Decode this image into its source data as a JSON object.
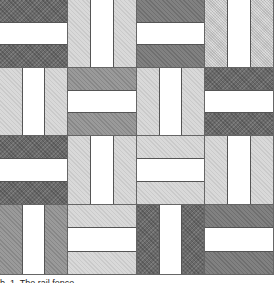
{
  "figure": {
    "type": "rail-fence quilt pattern",
    "grid": {
      "rows": 4,
      "cols": 4
    },
    "tones": {
      "white": "#ffffff",
      "dark": "#6a6a6a",
      "meddark": "#818181",
      "medium": "#9a9a9a",
      "light": "#d9d9d9",
      "lightspeck": "#d0d0d0"
    },
    "blocks": [
      [
        {
          "orientation": "h",
          "strips": [
            "dark",
            "white",
            "dark"
          ]
        },
        {
          "orientation": "v",
          "strips": [
            "light",
            "white",
            "light"
          ]
        },
        {
          "orientation": "h",
          "strips": [
            "meddark",
            "white",
            "meddark"
          ]
        },
        {
          "orientation": "v",
          "strips": [
            "lightspeck",
            "white",
            "lightspeck"
          ]
        }
      ],
      [
        {
          "orientation": "v",
          "strips": [
            "light",
            "white",
            "light"
          ]
        },
        {
          "orientation": "h",
          "strips": [
            "medium",
            "white",
            "medium"
          ]
        },
        {
          "orientation": "v",
          "strips": [
            "light",
            "white",
            "light"
          ]
        },
        {
          "orientation": "h",
          "strips": [
            "dark",
            "white",
            "dark"
          ]
        }
      ],
      [
        {
          "orientation": "h",
          "strips": [
            "dark",
            "white",
            "dark"
          ]
        },
        {
          "orientation": "v",
          "strips": [
            "light",
            "white",
            "light"
          ]
        },
        {
          "orientation": "h",
          "strips": [
            "light",
            "white",
            "light"
          ]
        },
        {
          "orientation": "v",
          "strips": [
            "light",
            "white",
            "light"
          ]
        }
      ],
      [
        {
          "orientation": "v",
          "strips": [
            "medium",
            "white",
            "medium"
          ]
        },
        {
          "orientation": "h",
          "strips": [
            "light",
            "white",
            "light"
          ]
        },
        {
          "orientation": "v",
          "strips": [
            "dark",
            "white",
            "dark"
          ]
        },
        {
          "orientation": "h",
          "strips": [
            "meddark",
            "white",
            "meddark"
          ]
        }
      ]
    ],
    "caption": "b. 1. The rail fence"
  }
}
